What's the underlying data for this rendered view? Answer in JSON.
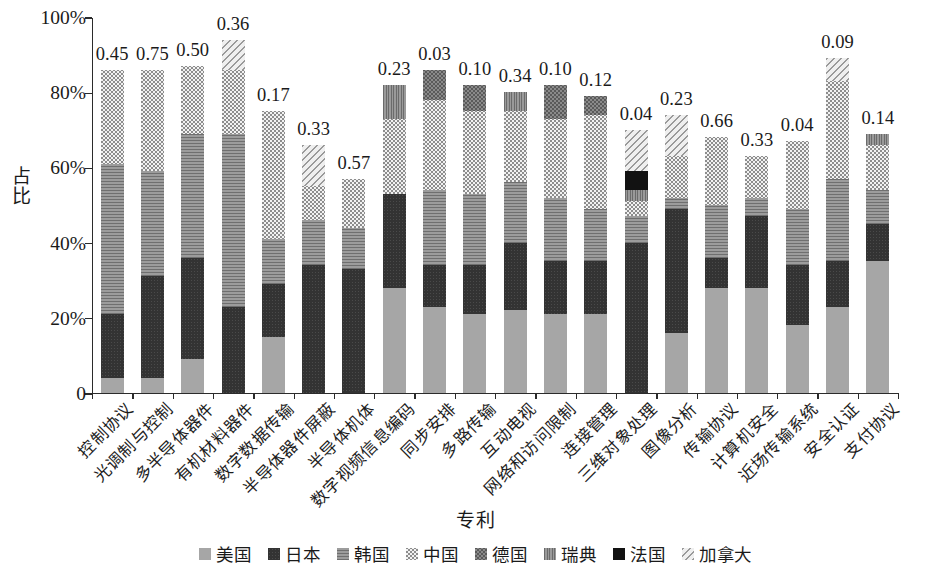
{
  "chart_data": {
    "type": "bar",
    "subtype": "stacked-bar-100-percent",
    "title": "",
    "xlabel": "专利",
    "ylabel": "占比",
    "ylim": [
      0,
      100
    ],
    "ytick_labels": [
      "0",
      "20%",
      "40%",
      "60%",
      "80%",
      "100%"
    ],
    "ytick_values": [
      0,
      20,
      40,
      60,
      80,
      100
    ],
    "grid": false,
    "legend_position": "bottom",
    "legend": [
      "美国",
      "日本",
      "韩国",
      "中国",
      "德国",
      "瑞典",
      "法国",
      "加拿大"
    ],
    "categories": [
      "控制协议",
      "光调制与控制",
      "多半导体器件",
      "有机材料器件",
      "数字数据传输",
      "半导体器件屏蔽",
      "半导体机体",
      "数字视频信息编码",
      "同步安排",
      "多路传输",
      "互动电视",
      "网络和访问限制",
      "连接管理",
      "三维对象处理",
      "图像分析",
      "传输协议",
      "计算机安全",
      "近场传输系统",
      "安全认证",
      "支付协议"
    ],
    "bar_labels": [
      "0.45",
      "0.75",
      "0.50",
      "0.36",
      "0.17",
      "0.33",
      "0.57",
      "0.23",
      "0.03",
      "0.10",
      "0.34",
      "0.10",
      "0.12",
      "0.04",
      "0.23",
      "0.66",
      "0.33",
      "0.04",
      "0.09",
      "0.14"
    ],
    "series": [
      {
        "name": "美国",
        "pattern": "us",
        "values": [
          4,
          4,
          9,
          0,
          15,
          0,
          0,
          28,
          23,
          21,
          22,
          21,
          21,
          0,
          16,
          28,
          28,
          18,
          23,
          35
        ]
      },
      {
        "name": "日本",
        "pattern": "jp",
        "values": [
          17,
          27,
          27,
          23,
          14,
          34,
          33,
          25,
          11,
          13,
          18,
          14,
          14,
          40,
          33,
          8,
          19,
          16,
          12,
          10
        ]
      },
      {
        "name": "韩国",
        "pattern": "kr",
        "values": [
          40,
          28,
          33,
          46,
          12,
          12,
          11,
          0,
          20,
          19,
          16,
          17,
          14,
          7,
          3,
          14,
          5,
          15,
          22,
          9
        ]
      },
      {
        "name": "中国",
        "pattern": "cn",
        "values": [
          25,
          27,
          18,
          17,
          34,
          9,
          13,
          20,
          24,
          22,
          19,
          21,
          25,
          4,
          11,
          18,
          11,
          18,
          26,
          12
        ]
      },
      {
        "name": "德国",
        "pattern": "de",
        "values": [
          0,
          0,
          0,
          0,
          0,
          0,
          0,
          0,
          8,
          7,
          0,
          9,
          5,
          0,
          0,
          0,
          0,
          0,
          0,
          0
        ]
      },
      {
        "name": "瑞典",
        "pattern": "se",
        "values": [
          0,
          0,
          0,
          0,
          0,
          0,
          0,
          9,
          0,
          0,
          5,
          0,
          0,
          3,
          0,
          0,
          0,
          0,
          0,
          3
        ]
      },
      {
        "name": "法国",
        "pattern": "fr",
        "values": [
          0,
          0,
          0,
          0,
          0,
          0,
          0,
          0,
          0,
          0,
          0,
          0,
          0,
          5,
          0,
          0,
          0,
          0,
          0,
          0
        ]
      },
      {
        "name": "加拿大",
        "pattern": "ca",
        "values": [
          0,
          0,
          0,
          8,
          0,
          11,
          0,
          0,
          0,
          0,
          0,
          0,
          0,
          11,
          11,
          0,
          0,
          0,
          6,
          0
        ]
      }
    ],
    "bar_totals": [
      86,
      86,
      87,
      94,
      75,
      66,
      57,
      82,
      86,
      82,
      80,
      82,
      79,
      70,
      74,
      68,
      63,
      67,
      89,
      69
    ]
  }
}
